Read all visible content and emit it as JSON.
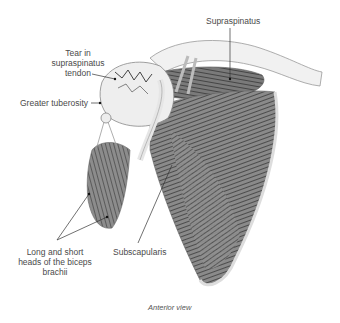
{
  "figure": {
    "labels": {
      "supraspinatus": "Supraspinatus",
      "tear_line1": "Tear in",
      "tear_line2": "supraspinatus",
      "tear_line3": "tendon",
      "greater_tuberosity": "Greater tuberosity",
      "biceps_line1": "Long and short",
      "biceps_line2": "heads of the biceps",
      "biceps_line3": "brachii",
      "subscapularis": "Subscapularis"
    },
    "caption": "Anterior view"
  }
}
